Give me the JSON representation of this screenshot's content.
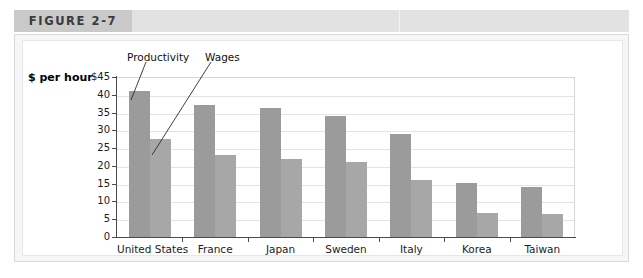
{
  "figure": {
    "tab_label": "FIGURE 2-7"
  },
  "chart_data": {
    "type": "bar",
    "title": "",
    "xlabel": "",
    "ylabel": "$ per hour",
    "ylim": [
      0,
      45
    ],
    "yticks": [
      0,
      5,
      10,
      15,
      20,
      25,
      30,
      35,
      40,
      45
    ],
    "ytick_labels": [
      "0",
      "5",
      "10",
      "15",
      "20",
      "25",
      "30",
      "35",
      "40",
      "$45"
    ],
    "grid": true,
    "legend_position": "inline-callout",
    "categories": [
      "United States",
      "France",
      "Japan",
      "Sweden",
      "Italy",
      "Korea",
      "Taiwan"
    ],
    "series": [
      {
        "name": "Productivity",
        "color": "#9b9b9b",
        "values": [
          41.2,
          37.0,
          36.2,
          34.0,
          29.0,
          15.2,
          14.0
        ]
      },
      {
        "name": "Wages",
        "color": "#a7a7a7",
        "values": [
          27.6,
          23.0,
          22.0,
          21.0,
          16.0,
          6.8,
          6.5
        ]
      }
    ],
    "annotations": [
      {
        "text": "Productivity",
        "target_series": "Productivity",
        "target_category": "United States"
      },
      {
        "text": "Wages",
        "target_series": "Wages",
        "target_category": "United States"
      }
    ]
  }
}
